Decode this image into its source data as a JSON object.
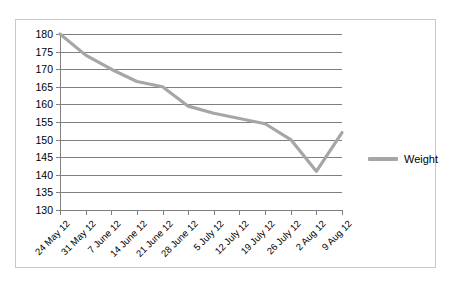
{
  "chart_data": {
    "type": "line",
    "title": "",
    "xlabel": "",
    "ylabel": "",
    "ylim": [
      130,
      180
    ],
    "ytick_step": 5,
    "yticks": [
      180,
      175,
      170,
      165,
      160,
      155,
      150,
      145,
      140,
      135,
      130
    ],
    "categories": [
      "24 May 12",
      "31 May 12",
      "7 June 12",
      "14 June 12",
      "21 June 12",
      "28 June 12",
      "5 July 12",
      "12 July 12",
      "19 July 12",
      "26 July 12",
      "2 Aug 12",
      "9 Aug 12"
    ],
    "series": [
      {
        "name": "Weight",
        "color": "#a6a6a6",
        "values": [
          180,
          174,
          170,
          166.5,
          165,
          159.5,
          157.5,
          156,
          154.5,
          150,
          141,
          152
        ]
      }
    ],
    "grid": "horizontal",
    "legend_position": "right"
  },
  "legend": {
    "entries": [
      {
        "label": "Weight",
        "color": "#a6a6a6"
      }
    ]
  },
  "style": {
    "line_color": "#a6a6a6",
    "grid_color": "#808080",
    "axis_color": "#808080",
    "border_color": "#c9c9c9",
    "background": "#ffffff",
    "text_color": "#000000"
  }
}
